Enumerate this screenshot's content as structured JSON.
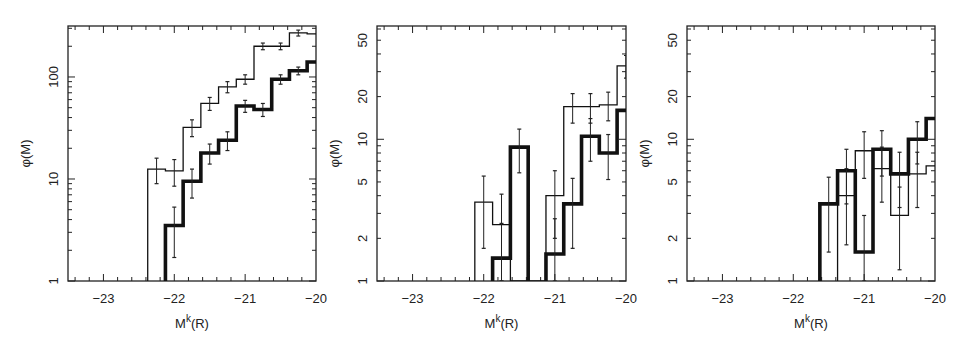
{
  "figure": {
    "panels": [
      {
        "id": "panel-1",
        "xlabel": "M",
        "xlabel_sup": "k",
        "xlabel_suffix": "(R)",
        "ylabel": "φ(M)",
        "ytick_labels": [
          "1",
          "10",
          "100"
        ],
        "xtick_labels": [
          "−23",
          "−22",
          "−21",
          "−20"
        ]
      },
      {
        "id": "panel-2",
        "xlabel": "M",
        "xlabel_sup": "k",
        "xlabel_suffix": "(R)",
        "ylabel": "φ(M)",
        "ytick_labels": [
          "1",
          "2",
          "5",
          "10",
          "20",
          "50"
        ],
        "xtick_labels": [
          "−23",
          "−22",
          "−21",
          "−20"
        ]
      },
      {
        "id": "panel-3",
        "xlabel": "M",
        "xlabel_sup": "k",
        "xlabel_suffix": "(R)",
        "ylabel": "φ(M)",
        "ytick_labels": [
          "1",
          "2",
          "5",
          "10",
          "20",
          "50"
        ],
        "xtick_labels": [
          "−23",
          "−22",
          "−21",
          "−20"
        ]
      }
    ]
  },
  "chart_data": [
    {
      "type": "line",
      "style": "step histogram, log y-axis",
      "title": "",
      "xlabel": "M^k(R)",
      "ylabel": "φ(M)",
      "xlim": [
        -23.5,
        -20
      ],
      "ylim": [
        1,
        316
      ],
      "yscale": "log",
      "xticks": [
        -23,
        -22,
        -21,
        -20
      ],
      "yticks": [
        1,
        10,
        100
      ],
      "grid": false,
      "bin_edges_start": -22.375,
      "bin_width": 0.25,
      "series": [
        {
          "name": "thin line",
          "line_width": "thin",
          "x_start": -22.375,
          "values": [
            12.5,
            12,
            32,
            55,
            80,
            95,
            200,
            200,
            270,
            265
          ],
          "errors": [
            3.5,
            3.5,
            6,
            8,
            10,
            10,
            15,
            15,
            18,
            0
          ]
        },
        {
          "name": "thick line",
          "line_width": "thick",
          "x_start": -22.125,
          "values": [
            3.5,
            9.5,
            18,
            24,
            52,
            48,
            95,
            115,
            140
          ],
          "errors": [
            1.8,
            3,
            4,
            5,
            7,
            7,
            10,
            10,
            0
          ]
        }
      ]
    },
    {
      "type": "line",
      "style": "step histogram, log y-axis",
      "title": "",
      "xlabel": "M^k(R)",
      "ylabel": "φ(M)",
      "xlim": [
        -23.5,
        -20
      ],
      "ylim": [
        1,
        63
      ],
      "yscale": "log",
      "xticks": [
        -23,
        -22,
        -21,
        -20
      ],
      "yticks": [
        1,
        2,
        5,
        10,
        20,
        50
      ],
      "grid": false,
      "bin_width": 0.25,
      "series": [
        {
          "name": "thin line",
          "line_width": "thin",
          "x_start": -22.125,
          "values": [
            3.6,
            2.5,
            1.0,
            1.0,
            4.0,
            17,
            17,
            17.5,
            33,
            31
          ],
          "errors": [
            1.9,
            1.6,
            0,
            0,
            2.0,
            4,
            4,
            4,
            6,
            0
          ]
        },
        {
          "name": "thick line",
          "line_width": "thick",
          "x_start": -21.875,
          "values": [
            1.45,
            8.8,
            0.0,
            1.55,
            3.5,
            10.5,
            8.0,
            16
          ],
          "errors": [
            1.1,
            3,
            0,
            1.2,
            1.8,
            3.5,
            2.8,
            0
          ]
        }
      ]
    },
    {
      "type": "line",
      "style": "step histogram, log y-axis",
      "title": "",
      "xlabel": "M^k(R)",
      "ylabel": "φ(M)",
      "xlim": [
        -23.5,
        -20
      ],
      "ylim": [
        1,
        63
      ],
      "yscale": "log",
      "xticks": [
        -23,
        -22,
        -21,
        -20
      ],
      "yticks": [
        1,
        2,
        5,
        10,
        20,
        50
      ],
      "grid": false,
      "bin_width": 0.25,
      "series": [
        {
          "name": "thin line",
          "line_width": "thin",
          "x_start": -21.375,
          "values": [
            4.0,
            8.3,
            6.2,
            2.9,
            5.7,
            6.5
          ],
          "errors": [
            2.2,
            3,
            2.6,
            1.7,
            2.4,
            0
          ]
        },
        {
          "name": "thick line",
          "line_width": "thick",
          "x_start": -21.625,
          "values": [
            3.5,
            6.0,
            1.6,
            8.5,
            5.7,
            10,
            14
          ],
          "errors": [
            1.9,
            2.5,
            1.3,
            3,
            2.4,
            3.3,
            0
          ]
        }
      ]
    }
  ]
}
